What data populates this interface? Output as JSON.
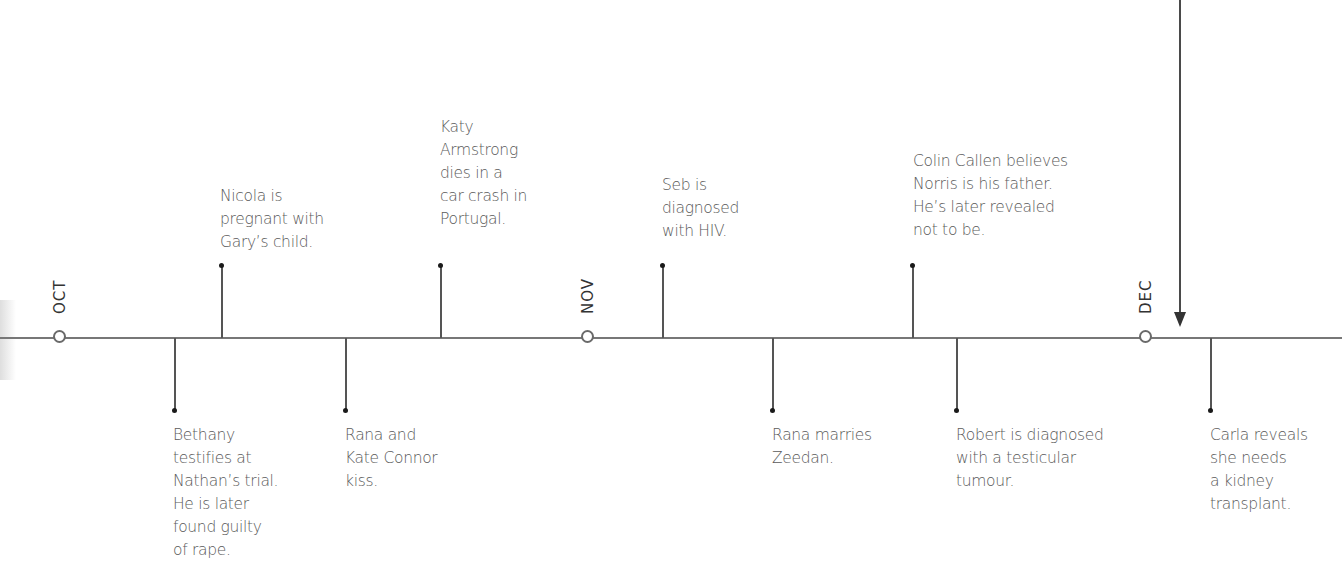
{
  "months": [
    {
      "label": "OCT",
      "x": 59
    },
    {
      "label": "NOV",
      "x": 587
    },
    {
      "label": "DEC",
      "x": 1145
    }
  ],
  "events_above": [
    {
      "x": 222,
      "text": "Nicola is\npregnant with\nGary’s child."
    },
    {
      "x": 441,
      "text": "Katy\nArmstrong\ndies in a\ncar crash in\nPortugal."
    },
    {
      "x": 663,
      "text": "Seb is\ndiagnosed\nwith HIV."
    },
    {
      "x": 913,
      "text": "Colin Callen believes\nNorris is his father.\nHe’s later revealed\nnot to be."
    }
  ],
  "events_below": [
    {
      "x": 175,
      "text": "Bethany\ntestifies at\nNathan’s trial.\nHe is later\nfound guilty\nof rape."
    },
    {
      "x": 346,
      "text": "Rana and\nKate Connor\nkiss."
    },
    {
      "x": 773,
      "text": "Rana marries\nZeedan."
    },
    {
      "x": 957,
      "text": "Robert is diagnosed\nwith a testicular\ntumour."
    },
    {
      "x": 1211,
      "text": "Carla reveals\nshe needs\na kidney\ntransplant."
    }
  ],
  "pointer": {
    "icon": "down-arrow-icon",
    "x": 1180
  },
  "colors": {
    "line": "#777777",
    "text": "#5a5a5a",
    "dot": "#1a1a1a"
  }
}
